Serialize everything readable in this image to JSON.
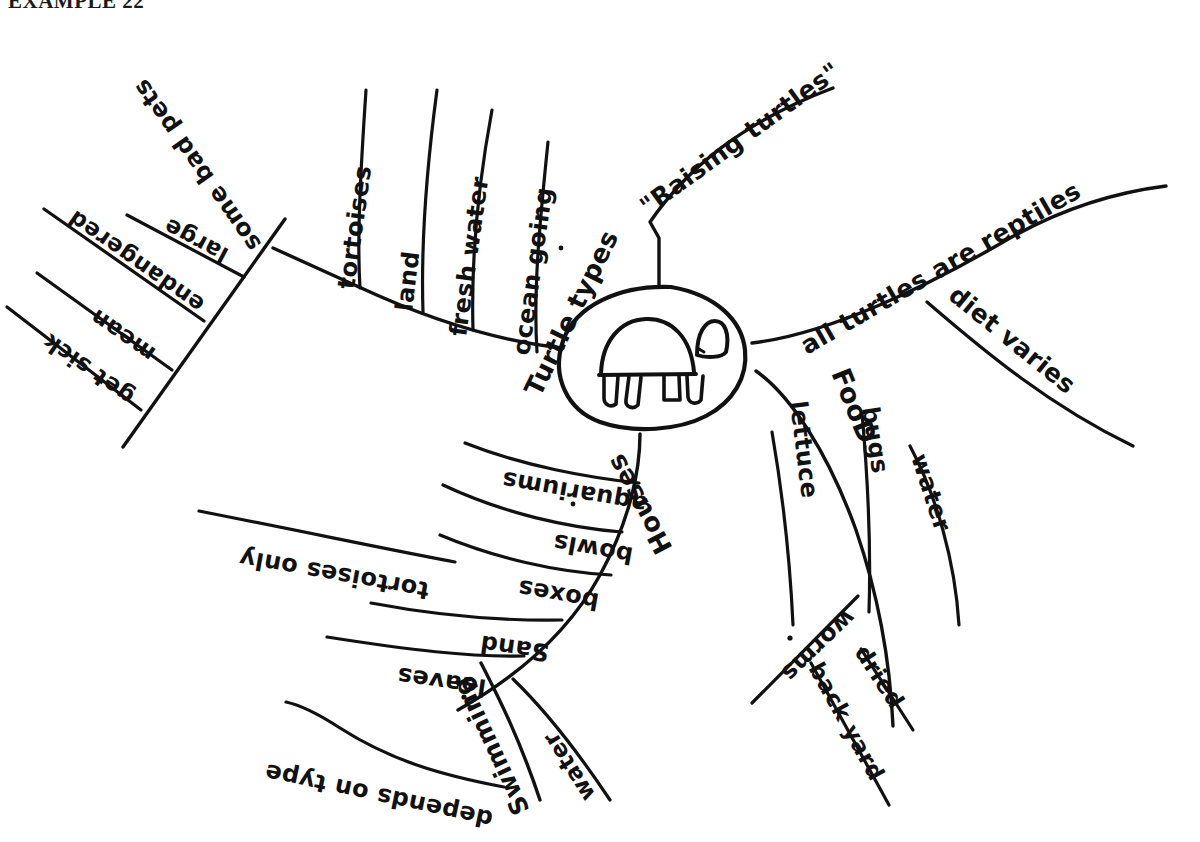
{
  "header": {
    "title": "EXAMPLE 22"
  },
  "center": {
    "icon": "turtle-drawing",
    "label": ""
  },
  "branches": [
    {
      "id": "raising-turtles",
      "label": "\"Raising turtles\"",
      "children": []
    },
    {
      "id": "all-turtles-are-reptiles",
      "label": "all turtles are reptiles",
      "children": [
        {
          "id": "diet-varies",
          "label": "diet varies"
        }
      ]
    },
    {
      "id": "food",
      "label": "FooD",
      "children": [
        {
          "id": "lettuce",
          "label": "lettuce"
        },
        {
          "id": "bugs",
          "label": "bugs"
        },
        {
          "id": "water",
          "label": "water"
        },
        {
          "id": "worms",
          "label": "worms"
        },
        {
          "id": "dried",
          "label": "dried"
        },
        {
          "id": "back-yard",
          "label": "back yard"
        }
      ]
    },
    {
      "id": "turtle-types",
      "label": "Turtle types",
      "children": [
        {
          "id": "tortoises",
          "label": "tortoises"
        },
        {
          "id": "land",
          "label": "land"
        },
        {
          "id": "fresh-water",
          "label": "fresh water"
        },
        {
          "id": "ocean-going",
          "label": "ocean going"
        }
      ]
    },
    {
      "id": "some-bad-pets",
      "label": "some bad pets",
      "children": [
        {
          "id": "large",
          "label": "large"
        },
        {
          "id": "endangered",
          "label": "endangered"
        },
        {
          "id": "mean",
          "label": "mean"
        },
        {
          "id": "get-sick",
          "label": "get sick"
        }
      ]
    },
    {
      "id": "houses",
      "label": "Houses",
      "children": [
        {
          "id": "aquariums",
          "label": "aquariums"
        },
        {
          "id": "bowls",
          "label": "bowls"
        },
        {
          "id": "boxes",
          "label": "boxes"
        },
        {
          "id": "tortoises-only",
          "label": "tortoises only"
        },
        {
          "id": "sand",
          "label": "Sand"
        },
        {
          "id": "leaves",
          "label": "leaves"
        }
      ]
    },
    {
      "id": "swimming",
      "label": "Swimming",
      "children": [
        {
          "id": "swim-water",
          "label": "water"
        },
        {
          "id": "depends-on-type",
          "label": "depends on type"
        }
      ]
    }
  ],
  "colors": {
    "ink": "#111111",
    "paper": "#ffffff"
  }
}
